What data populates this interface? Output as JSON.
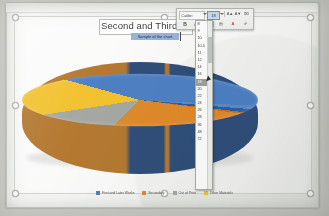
{
  "document": {
    "chart_title": "Second and Third",
    "chart_subtitle": "Sample of the chart"
  },
  "mini_toolbar": {
    "font_name": "Calibri",
    "font_size": "18",
    "buttons": [
      {
        "name": "grow-font",
        "glyph": "A▲"
      },
      {
        "name": "shrink-font",
        "glyph": "A▼"
      },
      {
        "name": "clear-formatting",
        "glyph": "⌧"
      },
      {
        "name": "styles",
        "glyph": "≡"
      },
      {
        "name": "bold",
        "glyph": "B"
      },
      {
        "name": "italic",
        "glyph": "I"
      },
      {
        "name": "underline",
        "glyph": "U"
      },
      {
        "name": "highlight",
        "glyph": "▤"
      },
      {
        "name": "font-color",
        "glyph": "A"
      },
      {
        "name": "format-painter",
        "glyph": "✐"
      }
    ]
  },
  "font_size_dropdown": {
    "selected": "18",
    "options": [
      "8",
      "9",
      "10",
      "10.5",
      "11",
      "12",
      "14",
      "16",
      "18",
      "20",
      "22",
      "24",
      "26",
      "28",
      "36",
      "48",
      "72"
    ]
  },
  "chart_data": {
    "type": "pie",
    "title": "Second and Third",
    "categories": [
      "First and Later Works",
      "Secondary",
      "Out of Print",
      "Other Materials"
    ],
    "values": [
      43,
      28,
      13,
      16
    ],
    "colors": [
      "#4e81c4",
      "#e08a2b",
      "#a6a8a4",
      "#f2c230"
    ],
    "legend_position": "bottom",
    "three_d": true,
    "xlabel": "",
    "ylabel": ""
  },
  "selection": {
    "handle_count": 8,
    "object": "chart"
  }
}
